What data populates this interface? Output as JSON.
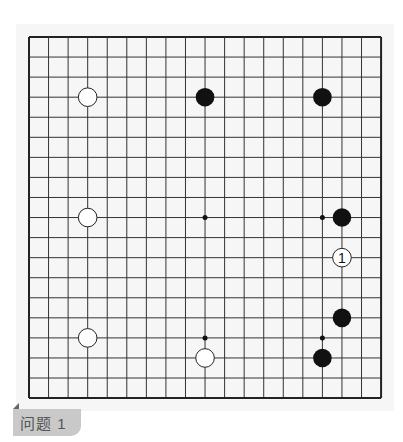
{
  "board": {
    "size": 19,
    "origin_x": 29,
    "origin_y": 37,
    "spacing_x": 19.56,
    "spacing_y": 20.06,
    "line_color": "#333333",
    "border_color": "#222222",
    "star_points": [
      [
        9,
        9
      ],
      [
        15,
        9
      ],
      [
        9,
        15
      ],
      [
        15,
        15
      ]
    ],
    "stones": [
      {
        "color": "white",
        "col": 3,
        "row": 3
      },
      {
        "color": "black",
        "col": 9,
        "row": 3
      },
      {
        "color": "black",
        "col": 15,
        "row": 3
      },
      {
        "color": "white",
        "col": 3,
        "row": 9
      },
      {
        "color": "black",
        "col": 16,
        "row": 9
      },
      {
        "color": "white",
        "col": 16,
        "row": 11,
        "label": "1"
      },
      {
        "color": "black",
        "col": 16,
        "row": 14
      },
      {
        "color": "white",
        "col": 3,
        "row": 15
      },
      {
        "color": "white",
        "col": 9,
        "row": 16
      },
      {
        "color": "black",
        "col": 15,
        "row": 16
      }
    ]
  },
  "caption": {
    "label": "问题 1"
  }
}
